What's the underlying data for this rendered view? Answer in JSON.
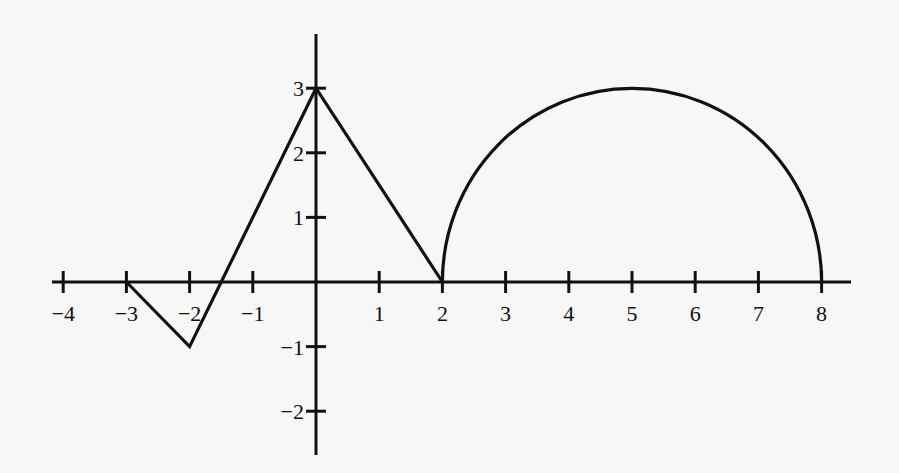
{
  "chart_data": {
    "type": "line",
    "title": "",
    "xlabel": "",
    "ylabel": "",
    "xlim": [
      -4,
      8
    ],
    "ylim": [
      -2,
      3
    ],
    "grid": false,
    "legend": null,
    "x_ticks": [
      -4,
      -3,
      -2,
      -1,
      1,
      2,
      3,
      4,
      5,
      6,
      7,
      8
    ],
    "x_tick_labels": [
      "−4",
      "−3",
      "−2",
      "−1",
      "1",
      "2",
      "3",
      "4",
      "5",
      "6",
      "7",
      "8"
    ],
    "y_ticks": [
      3,
      2,
      1,
      -1,
      -2
    ],
    "y_tick_labels": [
      "3",
      "2",
      "1",
      "−1",
      "−2"
    ],
    "series": [
      {
        "name": "piecewise linear segment",
        "kind": "polyline",
        "points": [
          [
            -3,
            0
          ],
          [
            -2,
            -1
          ],
          [
            0,
            3
          ],
          [
            2,
            0
          ]
        ]
      },
      {
        "name": "semicircular arc",
        "kind": "arc",
        "center": [
          5,
          0
        ],
        "radius": 3,
        "from": [
          2,
          0
        ],
        "peak": [
          5,
          3
        ],
        "to": [
          8,
          0
        ]
      }
    ]
  }
}
